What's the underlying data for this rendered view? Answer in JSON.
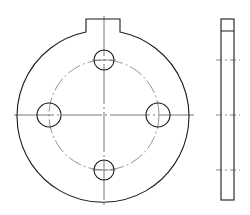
{
  "drawing": {
    "type": "technical-drawing",
    "subject": "circular flange plate with locating tab and 4 bolt holes",
    "views": [
      "front-view",
      "side-view"
    ],
    "colors": {
      "outline": "#1a1a1a",
      "centerline": "#555555",
      "background": "#ffffff"
    },
    "front_view": {
      "center": [
        104,
        115
      ],
      "outer_radius": 86,
      "tab": {
        "left": 86,
        "right": 120,
        "top": 19
      },
      "bolt_circle_radius": 55,
      "hole_radius": 11,
      "hole_count": 4
    },
    "side_view": {
      "x": 221,
      "width": 13,
      "top": 19,
      "bottom": 200,
      "tab_line_y": 31
    }
  }
}
